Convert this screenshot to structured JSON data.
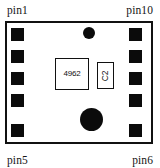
{
  "diagram": {
    "type": "pcb-footprint",
    "background_color": "#ffffff",
    "ink_color": "#111111"
  },
  "labels": {
    "top_left": "pin1",
    "top_right": "pin10",
    "bottom_left": "pin5",
    "bottom_right": "pin6"
  },
  "package": {
    "outline_color": "#111111",
    "fill_color": "#ffffff"
  },
  "pads": {
    "color": "#0b0b0b",
    "left_count": 5,
    "right_count": 5,
    "left": [
      {
        "name": "pad-pin1",
        "x": 11,
        "y": 28
      },
      {
        "name": "pad-pin2",
        "x": 11,
        "y": 50
      },
      {
        "name": "pad-pin3",
        "x": 11,
        "y": 72
      },
      {
        "name": "pad-pin4",
        "x": 11,
        "y": 94
      },
      {
        "name": "pad-pin5",
        "x": 11,
        "y": 124
      }
    ],
    "right": [
      {
        "name": "pad-pin10",
        "x": 129,
        "y": 28
      },
      {
        "name": "pad-pin9",
        "x": 129,
        "y": 50
      },
      {
        "name": "pad-pin8",
        "x": 129,
        "y": 72
      },
      {
        "name": "pad-pin7",
        "x": 129,
        "y": 94
      },
      {
        "name": "pad-pin6",
        "x": 129,
        "y": 124
      }
    ]
  },
  "components": {
    "ic": {
      "designator": "4962",
      "outline_color": "#111111"
    },
    "capacitor": {
      "designator": "C2",
      "outline_color": "#111111"
    }
  },
  "holes": [
    {
      "name": "via-top",
      "color": "#0b0b0b"
    },
    {
      "name": "mounting-hole-bottom",
      "color": "#0b0b0b"
    }
  ]
}
